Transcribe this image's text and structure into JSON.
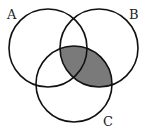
{
  "diagram": {
    "type": "venn",
    "sets": [
      {
        "label": "A",
        "cx": 48,
        "cy": 48,
        "r": 39
      },
      {
        "label": "B",
        "cx": 99,
        "cy": 48,
        "r": 39
      },
      {
        "label": "C",
        "cx": 74,
        "cy": 84,
        "r": 38
      }
    ],
    "shaded_region": "B ∩ C",
    "shade_color": "#7a7a7a",
    "stroke_color": "#111111"
  },
  "labels": {
    "a": "A",
    "b": "B",
    "c": "C"
  }
}
